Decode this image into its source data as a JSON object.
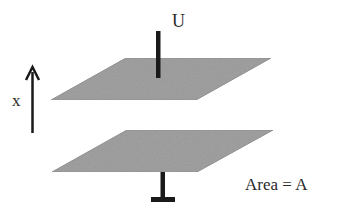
{
  "diagram": {
    "labels": {
      "voltage": "U",
      "axis": "x",
      "area": "Area = A"
    },
    "plates": [
      {
        "name": "top-plate",
        "points": "126,58 271,58 196,100 51,100"
      },
      {
        "name": "bottom-plate",
        "points": "127,130 273,130 197,172 52,172"
      }
    ],
    "colors": {
      "plate_fill": "#9a9a9a",
      "plate_edge": "#8c8c8c",
      "wire": "#1a1a1a",
      "text": "#2a2a2a",
      "background": "#ffffff"
    }
  }
}
